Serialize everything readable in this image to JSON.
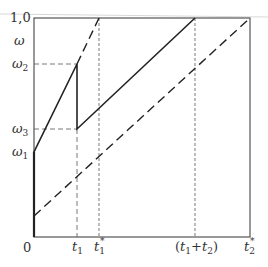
{
  "figure": {
    "y_axis": {
      "top_label": "1,0",
      "omega": "ω",
      "omega2_base": "ω",
      "omega2_sub": "2",
      "omega3_base": "ω",
      "omega3_sub": "3",
      "omega1_base": "ω",
      "omega1_sub": "1"
    },
    "x_axis": {
      "origin": "0",
      "t1_base": "t",
      "t1_sub": "1",
      "t1star_base": "t",
      "t1star_sub": "1",
      "t1star_sup": "*",
      "t1t2_open": "(",
      "t1t2_a": "t",
      "t1t2_a_sub": "1",
      "t1t2_plus": "+",
      "t1t2_b": "t",
      "t1t2_b_sub": "2",
      "t1t2_close": ")",
      "t2star_base": "t",
      "t2star_sub": "2",
      "t2star_sup": "*"
    },
    "colors": {
      "line": "#222222",
      "guide": "#555555",
      "frame": "#333333"
    }
  }
}
